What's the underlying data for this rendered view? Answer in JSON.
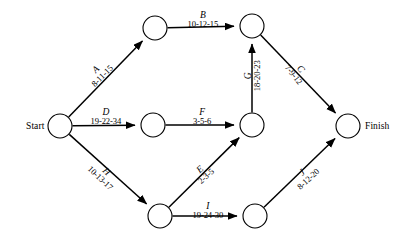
{
  "diagram": {
    "type": "pert-cpm-network",
    "title": "",
    "duration_format": "optimistic-most_likely-pessimistic",
    "terminals": {
      "start_label": "Start",
      "finish_label": "Finish"
    },
    "nodes": [
      {
        "id": "start",
        "label": "Start",
        "cx": 60,
        "cy": 126,
        "r": 12
      },
      {
        "id": "n1",
        "label": "",
        "cx": 155,
        "cy": 28,
        "r": 12
      },
      {
        "id": "n2",
        "label": "",
        "cx": 252,
        "cy": 26,
        "r": 12
      },
      {
        "id": "n3",
        "label": "",
        "cx": 153,
        "cy": 125,
        "r": 12
      },
      {
        "id": "n4",
        "label": "",
        "cx": 252,
        "cy": 125,
        "r": 12
      },
      {
        "id": "n5",
        "label": "",
        "cx": 160,
        "cy": 216,
        "r": 12
      },
      {
        "id": "n6",
        "label": "",
        "cx": 255,
        "cy": 216,
        "r": 12
      },
      {
        "id": "finish",
        "label": "Finish",
        "cx": 348,
        "cy": 126,
        "r": 12
      }
    ],
    "edges": [
      {
        "id": "A",
        "activity": "A",
        "duration": "8-11-15",
        "from": "start",
        "to": "n1",
        "label_x": 99,
        "label_y": 73,
        "rotate": -45
      },
      {
        "id": "B",
        "activity": "B",
        "duration": "10-12-15",
        "from": "n1",
        "to": "n2",
        "label_x": 203,
        "label_y": 20,
        "rotate": 0
      },
      {
        "id": "C",
        "activity": "C",
        "duration": "7-9-12",
        "from": "n2",
        "to": "finish",
        "label_x": 297,
        "label_y": 72,
        "rotate": 52
      },
      {
        "id": "D",
        "activity": "D",
        "duration": "19-22-34",
        "from": "start",
        "to": "n3",
        "label_x": 106,
        "label_y": 117,
        "rotate": 0
      },
      {
        "id": "E",
        "activity": "E",
        "duration": "2-3-5",
        "from": "n5",
        "to": "n4",
        "label_x": 203,
        "label_y": 173,
        "rotate": -42
      },
      {
        "id": "F",
        "activity": "F",
        "duration": "3-5-6",
        "from": "n3",
        "to": "n4",
        "label_x": 202,
        "label_y": 117,
        "rotate": 0
      },
      {
        "id": "G",
        "activity": "G",
        "duration": "18-20-23",
        "from": "n4",
        "to": "n2",
        "label_x": 252,
        "label_y": 76,
        "rotate": -90
      },
      {
        "id": "H",
        "activity": "H",
        "duration": "10-13-17",
        "from": "start",
        "to": "n5",
        "label_x": 103,
        "label_y": 175,
        "rotate": 43
      },
      {
        "id": "I",
        "activity": "I",
        "duration": "19-24-30",
        "from": "n5",
        "to": "n6",
        "label_x": 208,
        "label_y": 211,
        "rotate": 0
      },
      {
        "id": "J",
        "activity": "J",
        "duration": "8-12-20",
        "from": "n6",
        "to": "finish",
        "label_x": 305,
        "label_y": 176,
        "rotate": -43
      }
    ],
    "colors": {
      "stroke": "#000000",
      "node_fill": "#ffffff",
      "background": "#ffffff",
      "text": "#000000"
    }
  }
}
